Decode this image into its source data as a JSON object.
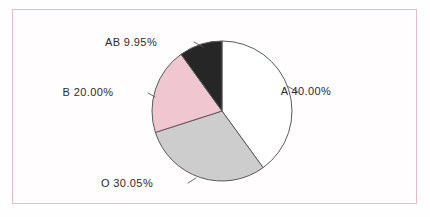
{
  "figure": {
    "background_color": "#fffdfe",
    "frame_color": "#e2bcc6",
    "outline_color": "#5a5a5a"
  },
  "chart_data": {
    "type": "pie",
    "title": "",
    "subtitle": "",
    "xlabel": "",
    "ylabel": "",
    "legend_position": "none",
    "grid": false,
    "start_angle_deg": 0,
    "direction": "clockwise",
    "center": {
      "x": 222,
      "y": 111
    },
    "radius": 70,
    "categories": [
      "A",
      "O",
      "B",
      "AB"
    ],
    "values": [
      40.0,
      30.05,
      20.0,
      9.95
    ],
    "value_unit": "%",
    "colors": [
      "#ffffff",
      "#cdcdcd",
      "#f0c6d0",
      "#262626"
    ],
    "slices": [
      {
        "name": "A",
        "label": "A  40.00%",
        "value": 40.0,
        "color": "#ffffff",
        "label_x": 306,
        "label_y": 95,
        "leader": "M 287,86 L 298,92"
      },
      {
        "name": "O",
        "label": "O  30.05%",
        "value": 30.05,
        "color": "#cdcdcd",
        "label_x": 127,
        "label_y": 187,
        "leader": "M 196,178 L 188,183"
      },
      {
        "name": "B",
        "label": "B  20.00%",
        "value": 20.0,
        "color": "#f0c6d0",
        "label_x": 88,
        "label_y": 96,
        "leader": "M 155,97 L 148,93"
      },
      {
        "name": "AB",
        "label": "AB  9.95%",
        "value": 9.95,
        "color": "#262626",
        "label_x": 131,
        "label_y": 46,
        "leader": "M 203,47 L 194,42"
      }
    ]
  }
}
